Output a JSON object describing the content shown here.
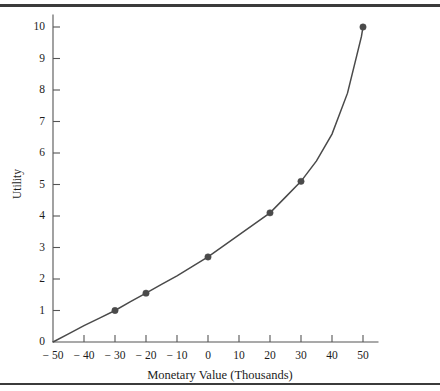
{
  "figure": {
    "name": "utility-function-figure",
    "top_rule_color": "#3b3b3b",
    "bottom_rule_color": "#3b3b3b",
    "background": "#ffffff"
  },
  "chart_data": {
    "type": "line",
    "title": "",
    "xlabel": "Monetary Value (Thousands)",
    "ylabel": "Utility",
    "xlim": [
      -50,
      55
    ],
    "ylim": [
      0,
      10.4
    ],
    "xticks": [
      -50,
      -40,
      -30,
      -20,
      -10,
      0,
      10,
      20,
      30,
      40,
      50
    ],
    "xticklabels": [
      "− 50",
      "− 40",
      "− 30",
      "− 20",
      "− 10",
      "0",
      "10",
      "20",
      "30",
      "40",
      "50"
    ],
    "yticks": [
      0,
      1,
      2,
      3,
      4,
      5,
      6,
      7,
      8,
      9,
      10
    ],
    "yticklabels": [
      "0",
      "1",
      "2",
      "3",
      "4",
      "5",
      "6",
      "7",
      "8",
      "9",
      "10"
    ],
    "grid": false,
    "legend": null,
    "line_color": "#4a4a4a",
    "marker_color": "#4a4a4a",
    "marker_shape": "circle",
    "series": [
      {
        "name": "Utility curve",
        "x": [
          -50,
          -45,
          -40,
          -35,
          -30,
          -25,
          -20,
          -15,
          -10,
          -5,
          0,
          5,
          10,
          15,
          20,
          25,
          30,
          35,
          40,
          45,
          48,
          49.5,
          50
        ],
        "y": [
          0,
          0.26,
          0.52,
          0.76,
          1.0,
          1.28,
          1.55,
          1.83,
          2.1,
          2.4,
          2.7,
          3.05,
          3.4,
          3.75,
          4.1,
          4.6,
          5.1,
          5.75,
          6.6,
          7.9,
          9.1,
          9.7,
          10.0
        ]
      }
    ],
    "data_points": [
      {
        "x": -50,
        "y": 0.0,
        "marked": false
      },
      {
        "x": -30,
        "y": 1.0,
        "marked": true
      },
      {
        "x": -20,
        "y": 1.55,
        "marked": true
      },
      {
        "x": 0,
        "y": 2.7,
        "marked": true
      },
      {
        "x": 20,
        "y": 4.1,
        "marked": true
      },
      {
        "x": 30,
        "y": 5.1,
        "marked": true
      },
      {
        "x": 50,
        "y": 10.0,
        "marked": true
      }
    ]
  }
}
